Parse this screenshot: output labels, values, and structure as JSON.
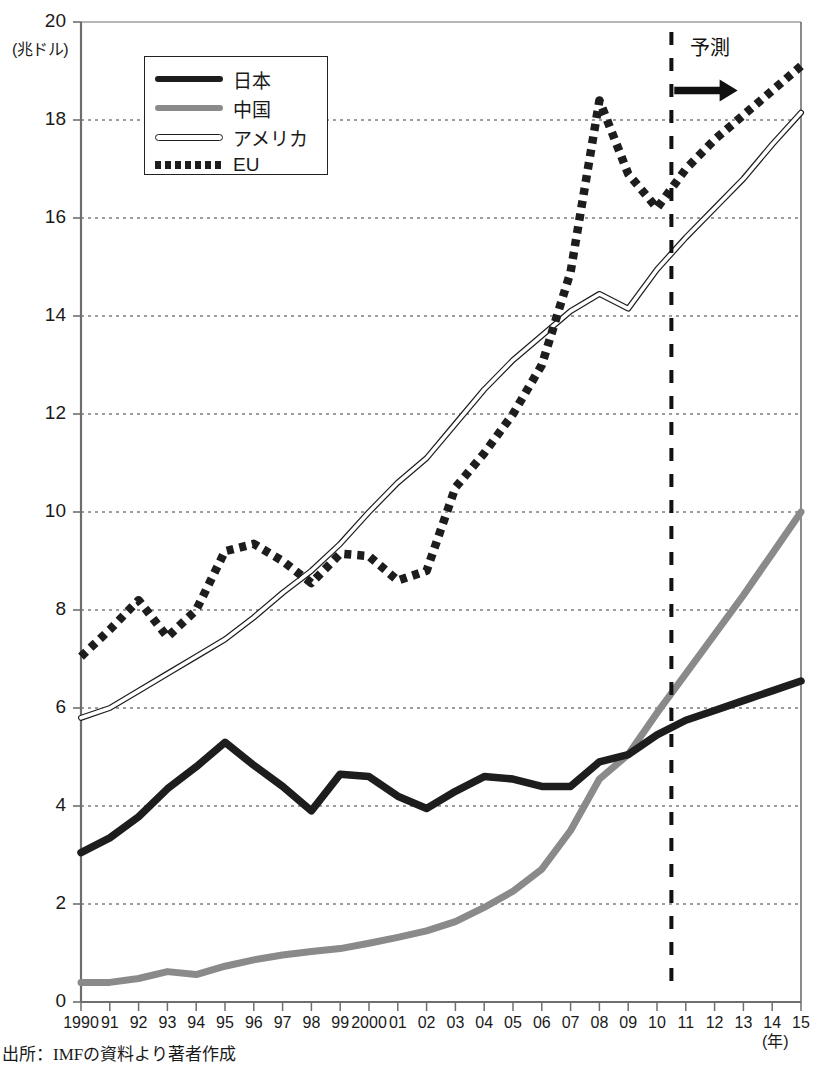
{
  "chart_data": {
    "type": "line",
    "title": "",
    "xlabel": "(年)",
    "ylabel": "(兆ドル)",
    "xlim": [
      1990,
      2015
    ],
    "ylim": [
      0,
      20
    ],
    "ytick_step": 2,
    "grid": "horizontal-dotted",
    "legend_position": "top-left-inside",
    "x": [
      1990,
      1991,
      1992,
      1993,
      1994,
      1995,
      1996,
      1997,
      1998,
      1999,
      2000,
      2001,
      2002,
      2003,
      2004,
      2005,
      2006,
      2007,
      2008,
      2009,
      2010,
      2011,
      2012,
      2013,
      2014,
      2015
    ],
    "categories": [
      "1990",
      "91",
      "92",
      "93",
      "94",
      "95",
      "96",
      "97",
      "98",
      "99",
      "2000",
      "01",
      "02",
      "03",
      "04",
      "05",
      "06",
      "07",
      "08",
      "09",
      "10",
      "11",
      "12",
      "13",
      "14",
      "15"
    ],
    "series": [
      {
        "name": "日本",
        "style": "thick-solid-black",
        "color": "#1d1d1d",
        "values": [
          3.05,
          3.35,
          3.78,
          4.35,
          4.8,
          5.3,
          4.83,
          4.4,
          3.9,
          4.65,
          4.6,
          4.2,
          3.95,
          4.3,
          4.6,
          4.55,
          4.4,
          4.4,
          4.9,
          5.05,
          5.45,
          5.75,
          5.95,
          6.15,
          6.35,
          6.55
        ]
      },
      {
        "name": "中国",
        "style": "thick-solid-gray",
        "color": "#8a8a8a",
        "values": [
          0.4,
          0.4,
          0.48,
          0.62,
          0.56,
          0.73,
          0.86,
          0.96,
          1.03,
          1.09,
          1.2,
          1.32,
          1.45,
          1.64,
          1.93,
          2.26,
          2.71,
          3.5,
          4.55,
          5.05,
          5.9,
          6.7,
          7.5,
          8.3,
          9.15,
          10.0
        ]
      },
      {
        "name": "アメリカ",
        "style": "thin-hollow-double",
        "color": "#1d1d1d",
        "values": [
          5.8,
          6.0,
          6.35,
          6.7,
          7.05,
          7.4,
          7.85,
          8.35,
          8.8,
          9.35,
          10.0,
          10.6,
          11.1,
          11.8,
          12.5,
          13.1,
          13.6,
          14.1,
          14.45,
          14.15,
          14.95,
          15.6,
          16.2,
          16.8,
          17.5,
          18.15
        ]
      },
      {
        "name": "EU",
        "style": "thick-dotted-black",
        "color": "#1d1d1d",
        "values": [
          7.05,
          7.6,
          8.2,
          7.45,
          8.0,
          9.2,
          9.35,
          9.0,
          8.55,
          9.15,
          9.1,
          8.6,
          8.8,
          10.5,
          11.2,
          12.0,
          13.0,
          14.9,
          18.4,
          16.9,
          16.2,
          17.0,
          17.6,
          18.1,
          18.6,
          19.1
        ]
      }
    ],
    "annotations": [
      {
        "name": "forecast-divider",
        "x": 2010.5,
        "type": "vertical-dashed-line"
      },
      {
        "name": "forecast-label",
        "text": "予測",
        "x": 2011.3,
        "y": 19.2
      },
      {
        "name": "forecast-arrow",
        "type": "right-arrow",
        "x_start": 2010.6,
        "x_end": 2012.8,
        "y": 18.6
      }
    ]
  },
  "axes": {
    "y_unit": "(兆ドル)",
    "x_unit": "(年)",
    "y_ticks": [
      "20",
      "18",
      "16",
      "14",
      "12",
      "10",
      "8",
      "6",
      "4",
      "2",
      "0"
    ],
    "x_ticks": [
      "1990",
      "91",
      "92",
      "93",
      "94",
      "95",
      "96",
      "97",
      "98",
      "99",
      "2000",
      "01",
      "02",
      "03",
      "04",
      "05",
      "06",
      "07",
      "08",
      "09",
      "10",
      "11",
      "12",
      "13",
      "14",
      "15"
    ]
  },
  "legend": {
    "items": [
      {
        "label": "日本",
        "swatch": "thick-solid-black"
      },
      {
        "label": "中国",
        "swatch": "thick-solid-gray"
      },
      {
        "label": "アメリカ",
        "swatch": "thin-hollow-double"
      },
      {
        "label": "EU",
        "swatch": "thick-dotted-black"
      }
    ]
  },
  "forecast": {
    "label": "予測"
  },
  "source": {
    "text": "出所：IMFの資料より著者作成"
  },
  "colors": {
    "japan": "#1d1d1d",
    "china": "#8a8a8a",
    "usa": "#1d1d1d",
    "eu": "#1d1d1d",
    "axis": "#6e6e6e",
    "grid": "#4a4a4a"
  }
}
